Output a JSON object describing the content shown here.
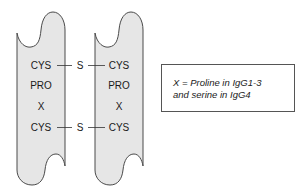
{
  "diagram": {
    "type": "IgG hinge region schematic",
    "colors": {
      "chain_fill": "#e6e6e6",
      "chain_stroke": "#4a4a4a",
      "text": "#1a1a1a",
      "bond_line": "#333333"
    },
    "chains": [
      {
        "id": "left",
        "residues": [
          "CYS",
          "PRO",
          "X",
          "CYS"
        ]
      },
      {
        "id": "right",
        "residues": [
          "CYS",
          "PRO",
          "X",
          "CYS"
        ]
      }
    ],
    "disulfide_bonds": [
      {
        "label": "S",
        "between": [
          "left.CYS.0",
          "right.CYS.0"
        ]
      },
      {
        "label": "S",
        "between": [
          "left.CYS.3",
          "right.CYS.3"
        ]
      }
    ],
    "legend": {
      "line1": "X = Proline in IgG1-3",
      "line2": "and serine in IgG4"
    }
  }
}
